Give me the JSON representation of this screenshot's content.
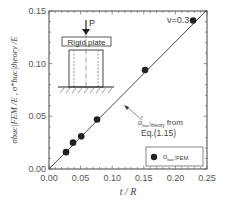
{
  "chart_data": {
    "type": "scatter",
    "title": "",
    "xlabel": "t / R",
    "ylabel": "σbuc|FEM /E ,  σ*buc|theory /E",
    "xlim": [
      0.0,
      0.25
    ],
    "ylim": [
      0.0,
      0.15
    ],
    "x_ticks": [
      "0.00",
      "0.05",
      "0.10",
      "0.15",
      "0.20",
      "0.25"
    ],
    "y_ticks": [
      "0.00",
      "0.05",
      "0.10",
      "0.15"
    ],
    "grid": false,
    "legend_position": "lower right",
    "series": [
      {
        "name": "σbuc|FEM",
        "kind": "scatter",
        "marker": "filled-circle",
        "x": [
          0.027,
          0.038,
          0.051,
          0.076,
          0.152,
          0.228
        ],
        "y": [
          0.016,
          0.025,
          0.031,
          0.047,
          0.094,
          0.141
        ]
      },
      {
        "name": "σ*buc|theory from Eq.(1.15)",
        "kind": "line",
        "x": [
          0.0,
          0.25
        ],
        "y": [
          0.0,
          0.151
        ]
      }
    ],
    "annotations": [
      {
        "text": "ν=0.3",
        "position": "top right"
      },
      {
        "text": "σ*buc|theory from Eq.(1.15)",
        "position": "right middle, arrow to line"
      },
      {
        "text": "Rigid plate",
        "position": "inset diagram, top left"
      },
      {
        "text": "P",
        "position": "inset diagram, load arrow"
      }
    ]
  },
  "labels": {
    "nu": "ν=0.3",
    "theory_line1": "from",
    "theory_sigma": "σ",
    "theory_sub": "buc",
    "theory_sub2": "theory",
    "theory_line2": "Eq.(1.15)",
    "legend_sigma": "σ",
    "legend_sub": "buc",
    "legend_sub2": "FEM",
    "inset_plate": "Rigid plate",
    "inset_load": "P",
    "xlabel": "t / R",
    "ylabel": "σbuc|FEM /E ,  σ*buc|theory /E"
  }
}
